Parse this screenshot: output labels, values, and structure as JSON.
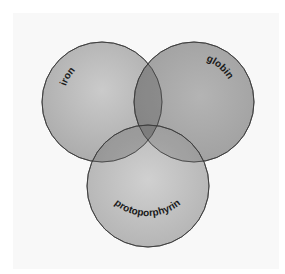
{
  "diagram": {
    "type": "venn",
    "sets": [
      {
        "id": "iron",
        "label": "iron",
        "cx": 102,
        "cy": 102,
        "r": 60,
        "color": "#b4b4b4"
      },
      {
        "id": "globin",
        "label": "globin",
        "cx": 194,
        "cy": 102,
        "r": 60,
        "color": "#9a9a9a"
      },
      {
        "id": "protoporphyrin",
        "label": "protoporphyrin",
        "cx": 148,
        "cy": 186,
        "r": 61,
        "color": "#b0b0b0"
      }
    ],
    "colors": {
      "background": "#ffffff",
      "panel": "#f8f8f8",
      "outline": "#3a3a3a",
      "label_text": "#1a1a1a"
    }
  }
}
